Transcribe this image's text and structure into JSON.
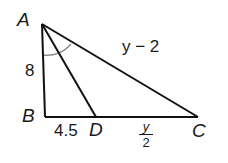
{
  "diagram": {
    "type": "triangle-angle-bisector",
    "vertices": {
      "A": {
        "label": "A",
        "x": 42,
        "y": 24
      },
      "B": {
        "label": "B",
        "x": 45,
        "y": 117
      },
      "C": {
        "label": "C",
        "x": 198,
        "y": 117
      },
      "D": {
        "label": "D",
        "x": 96,
        "y": 117
      }
    },
    "segments": [
      {
        "from": "A",
        "to": "B",
        "label": "8"
      },
      {
        "from": "B",
        "to": "D",
        "label": "4.5"
      },
      {
        "from": "D",
        "to": "C",
        "label": "y/2"
      },
      {
        "from": "A",
        "to": "C",
        "label": "y − 2"
      },
      {
        "from": "A",
        "to": "D",
        "label": ""
      }
    ],
    "labels": {
      "A": "A",
      "B": "B",
      "C": "C",
      "D": "D",
      "AB": "8",
      "BD": "4.5",
      "AC": "y − 2",
      "DC_num": "y",
      "DC_den": "2"
    },
    "angle_mark": {
      "vertex": "A",
      "between": [
        "B",
        "C"
      ],
      "color": "#8a8a8a"
    },
    "colors": {
      "stroke": "#111111",
      "text": "#1a1a1a",
      "arc": "#8a8a8a"
    }
  }
}
